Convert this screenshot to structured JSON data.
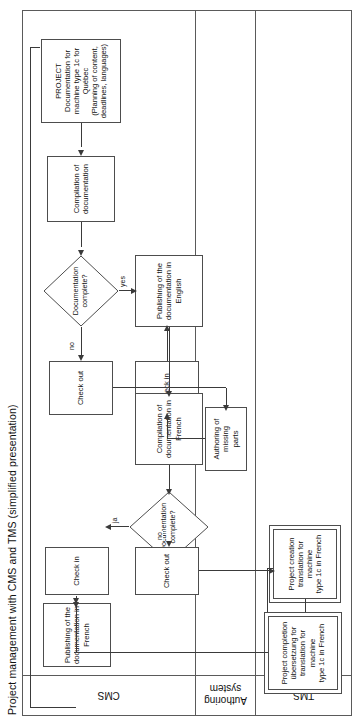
{
  "diagram": {
    "title": "Project management with CMS and TMS (simplified presentation)",
    "type": "swimlane-flowchart",
    "orientation": "rotated-90-ccw",
    "flow_direction": "right-to-left",
    "lanes": [
      {
        "id": "cms",
        "label": "CMS"
      },
      {
        "id": "authoring",
        "label": "Authoring\nsystem"
      },
      {
        "id": "tms",
        "label": "TMS"
      }
    ],
    "nodes": [
      {
        "id": "project",
        "lane": "cms",
        "shape": "rectangle",
        "text": "PROJECT\nDocumentation for\nmachine type 1c for\nQuébec\n(Planning of content,\ndeadlines, languages)"
      },
      {
        "id": "compilation-doc",
        "lane": "cms",
        "shape": "rectangle",
        "text": "Compilation of\ndocumentation"
      },
      {
        "id": "decision-en",
        "lane": "cms",
        "shape": "diamond",
        "text": "Documentation\ncomplete?"
      },
      {
        "id": "check-out-en",
        "lane": "cms",
        "shape": "rectangle",
        "text": "Check out"
      },
      {
        "id": "authoring-missing",
        "lane": "authoring",
        "shape": "rectangle",
        "text": "Authoring of missing\nparts"
      },
      {
        "id": "check-in-en",
        "lane": "cms",
        "shape": "rectangle",
        "text": "Check in"
      },
      {
        "id": "publish-en",
        "lane": "cms",
        "shape": "rectangle",
        "text": "Publishing of the\ndocumentation in\nEnglish"
      },
      {
        "id": "compilation-fr",
        "lane": "cms",
        "shape": "rectangle",
        "text": "Compilation of\ndocumentation in\nFrench"
      },
      {
        "id": "decision-fr",
        "lane": "cms",
        "shape": "diamond",
        "text": "Documentation\ncomplete?"
      },
      {
        "id": "check-out-fr",
        "lane": "cms",
        "shape": "rectangle",
        "text": "Check out"
      },
      {
        "id": "project-creation",
        "lane": "tms",
        "shape": "rectangle-double",
        "text": "Project creation\ntranslation for machine\ntype 1c in French"
      },
      {
        "id": "translating-missing",
        "lane": "tms",
        "shape": "rectangle",
        "text": "Translating of missing\nparts"
      },
      {
        "id": "project-completion",
        "lane": "tms",
        "shape": "rectangle-double",
        "text": "Project completion\nübersetzung for\ntranslation for machine\ntype 1c in French"
      },
      {
        "id": "check-in-fr",
        "lane": "cms",
        "shape": "rectangle",
        "text": "Check in"
      },
      {
        "id": "publish-fr",
        "lane": "cms",
        "shape": "rectangle",
        "text": "Publishing of the\ndocumentation in\nFrench"
      }
    ],
    "edge_labels": {
      "decision_en_no": "no",
      "decision_en_yes": "yes",
      "decision_fr_no": "no",
      "decision_fr_yes": "ja"
    },
    "colors": {
      "background": "#ffffff",
      "stroke": "#4d4d4d",
      "frame": "#5a5a5a",
      "connector": "#3a3a3a",
      "text": "#111111"
    }
  }
}
